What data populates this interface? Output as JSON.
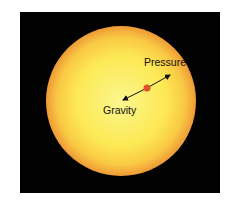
{
  "diagram": {
    "background_color": "#020202",
    "star": {
      "center_color": "#fbf58a",
      "mid_color": "#fde84a",
      "edge_color": "#f2a23a"
    },
    "particle_color": "#e2502a",
    "labels": {
      "pressure": "Pressure",
      "gravity": "Gravity"
    }
  }
}
